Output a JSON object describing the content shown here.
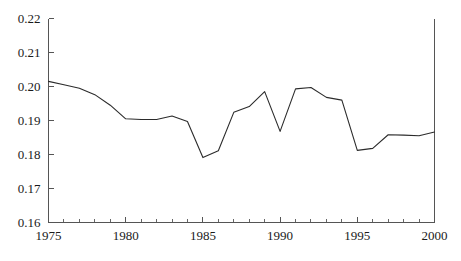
{
  "chart_data": {
    "type": "line",
    "title": "",
    "subtitle": "",
    "xlabel": "",
    "ylabel": "",
    "xlim": [
      1975,
      2000
    ],
    "ylim": [
      0.16,
      0.22
    ],
    "grid": false,
    "legend": false,
    "legend_position": "none",
    "line_color": "#2b2b2b",
    "axis_color": "#555555",
    "background_color": "#ffffff",
    "y_ticks": [
      "0.16",
      "0.17",
      "0.18",
      "0.19",
      "0.20",
      "0.21",
      "0.22"
    ],
    "y_tick_values": [
      0.16,
      0.17,
      0.18,
      0.19,
      0.2,
      0.21,
      0.22
    ],
    "x_ticks": [
      "1975",
      "1980",
      "1985",
      "1990",
      "1995",
      "2000"
    ],
    "x_tick_values": [
      1975,
      1980,
      1985,
      1990,
      1995,
      2000
    ],
    "x_minor_tick_values": [
      1976,
      1977,
      1978,
      1979,
      1981,
      1982,
      1983,
      1984,
      1986,
      1987,
      1988,
      1989,
      1991,
      1992,
      1993,
      1994,
      1996,
      1997,
      1998,
      1999
    ],
    "x": [
      1975,
      1976,
      1977,
      1978,
      1979,
      1980,
      1981,
      1982,
      1983,
      1984,
      1985,
      1986,
      1987,
      1988,
      1989,
      1990,
      1991,
      1992,
      1993,
      1994,
      1995,
      1996,
      1997,
      1998,
      1999,
      2000
    ],
    "values": [
      0.2015,
      0.2005,
      0.1995,
      0.1976,
      0.1945,
      0.1905,
      0.1903,
      0.1903,
      0.1913,
      0.1897,
      0.1791,
      0.1811,
      0.1924,
      0.1941,
      0.1985,
      0.1868,
      0.1993,
      0.1997,
      0.1968,
      0.196,
      0.1812,
      0.1818,
      0.1858,
      0.1857,
      0.1855,
      0.1866
    ],
    "series": [
      {
        "name": "series-1",
        "values": [
          0.2015,
          0.2005,
          0.1995,
          0.1976,
          0.1945,
          0.1905,
          0.1903,
          0.1903,
          0.1913,
          0.1897,
          0.1791,
          0.1811,
          0.1924,
          0.1941,
          0.1985,
          0.1868,
          0.1993,
          0.1997,
          0.1968,
          0.196,
          0.1812,
          0.1818,
          0.1858,
          0.1857,
          0.1855,
          0.1866
        ]
      }
    ]
  }
}
